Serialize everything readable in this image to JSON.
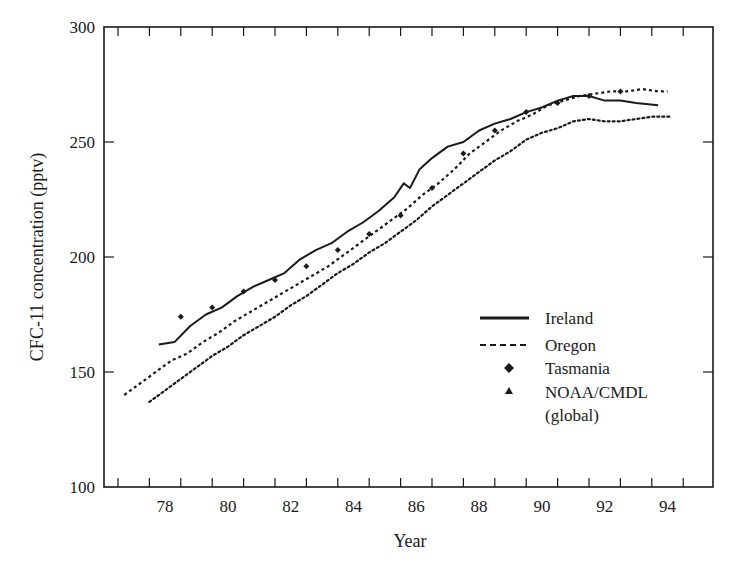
{
  "chart_data": {
    "type": "line",
    "title": "",
    "xlabel": "Year",
    "ylabel": "CFC-11 concentration (pptv)",
    "xlim": [
      76.8,
      95.5
    ],
    "ylim": [
      100,
      300
    ],
    "x_tick_labels": [
      "78",
      "80",
      "82",
      "84",
      "86",
      "88",
      "90",
      "92",
      "94"
    ],
    "y_tick_labels": [
      "100",
      "150",
      "200",
      "250",
      "300"
    ],
    "grid": false,
    "legend_position": "lower right (inside plot)",
    "series": [
      {
        "name": "Ireland",
        "style": "solid",
        "x": [
          78.3,
          78.8,
          79.3,
          79.8,
          80.3,
          80.8,
          81.3,
          81.8,
          82.3,
          82.8,
          83.3,
          83.8,
          84.3,
          84.8,
          85.3,
          85.8,
          86.1,
          86.3,
          86.6,
          87.0,
          87.5,
          88.0,
          88.5,
          89.0,
          89.5,
          90.0,
          90.5,
          91.0,
          91.5,
          92.0,
          92.5,
          93.0,
          93.5,
          94.2
        ],
        "values": [
          162,
          163,
          170,
          175,
          178,
          183,
          187,
          190,
          193,
          199,
          203,
          206,
          211,
          215,
          220,
          226,
          232,
          230,
          238,
          243,
          248,
          250,
          255,
          258,
          260,
          263,
          265,
          268,
          270,
          270,
          268,
          268,
          267,
          266
        ]
      },
      {
        "name": "Oregon",
        "style": "dashed",
        "x": [
          77.2,
          77.7,
          78.2,
          78.7,
          79.2,
          79.7,
          80.2,
          80.7,
          81.2,
          81.7,
          82.2,
          82.7,
          83.2,
          83.7,
          84.2,
          84.7,
          85.2,
          85.7,
          86.2,
          86.7,
          87.2,
          87.7,
          88.2,
          88.7,
          89.2,
          89.7,
          90.2,
          90.7,
          91.2,
          91.7,
          92.2,
          92.7,
          93.2,
          93.7,
          94.2,
          94.5
        ],
        "values": [
          140,
          145,
          150,
          155,
          158,
          163,
          167,
          172,
          176,
          180,
          184,
          188,
          192,
          196,
          201,
          206,
          211,
          216,
          221,
          227,
          232,
          238,
          245,
          250,
          255,
          259,
          262,
          266,
          268,
          270,
          271,
          272,
          272,
          273,
          272,
          272
        ]
      },
      {
        "name": "Tasmania",
        "style": "markers-diamond",
        "x": [
          79.0,
          80.0,
          81.0,
          82.0,
          83.0,
          84.0,
          85.0,
          86.0,
          87.0,
          88.0,
          89.0,
          90.0,
          91.0,
          92.0,
          93.0
        ],
        "values": [
          174,
          178,
          185,
          190,
          196,
          203,
          210,
          218,
          230,
          245,
          255,
          263,
          267,
          270,
          272
        ]
      },
      {
        "name": "NOAA/CMDL (global)",
        "style": "markers-triangle",
        "x": [
          78.0,
          78.5,
          79.0,
          79.5,
          80.0,
          80.5,
          81.0,
          81.5,
          82.0,
          82.5,
          83.0,
          83.5,
          84.0,
          84.5,
          85.0,
          85.5,
          86.0,
          86.5,
          87.0,
          87.5,
          88.0,
          88.5,
          89.0,
          89.5,
          90.0,
          90.5,
          91.0,
          91.5,
          92.0,
          92.5,
          93.0,
          93.5,
          94.0,
          94.6
        ],
        "values": [
          137,
          142,
          147,
          152,
          157,
          161,
          166,
          170,
          174,
          179,
          183,
          188,
          193,
          197,
          202,
          206,
          211,
          216,
          222,
          227,
          232,
          237,
          242,
          246,
          251,
          254,
          256,
          259,
          260,
          259,
          259,
          260,
          261,
          261
        ]
      }
    ]
  },
  "axes": {
    "x_title": "Year",
    "y_title": "CFC-11 concentration (pptv)"
  },
  "legend": {
    "items": [
      {
        "label": "Ireland",
        "marker": "solid-line"
      },
      {
        "label": "Oregon",
        "marker": "dashed-line"
      },
      {
        "label": "Tasmania",
        "marker": "diamond"
      },
      {
        "label": "NOAA/CMDL",
        "marker": "triangle"
      },
      {
        "label": "(global)",
        "marker": "none"
      }
    ]
  }
}
